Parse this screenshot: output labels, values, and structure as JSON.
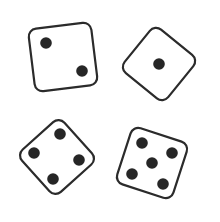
{
  "scene": {
    "description": "Four dice on a white background",
    "background": "#ffffff",
    "stroke_color": "#2b2b2b",
    "pip_color": "#262626"
  },
  "dice": [
    {
      "name": "die-two",
      "value": 2,
      "cx": 63,
      "cy": 57,
      "size": 63,
      "rotation": -7,
      "pips": [
        [
          46,
          43
        ],
        [
          82,
          71
        ]
      ]
    },
    {
      "name": "die-one",
      "value": 1,
      "cx": 159,
      "cy": 64,
      "size": 56,
      "rotation": 39,
      "pips": [
        [
          159,
          64
        ]
      ]
    },
    {
      "name": "die-four",
      "value": 4,
      "cx": 57,
      "cy": 157,
      "size": 57,
      "rotation": 48,
      "pips": [
        [
          60,
          134
        ],
        [
          34,
          153
        ],
        [
          79,
          160
        ],
        [
          53,
          179
        ]
      ]
    },
    {
      "name": "die-five",
      "value": 5,
      "cx": 152,
      "cy": 163,
      "size": 59,
      "rotation": 18,
      "pips": [
        [
          142,
          143
        ],
        [
          172,
          153
        ],
        [
          152,
          163
        ],
        [
          132,
          174
        ],
        [
          163,
          184
        ]
      ]
    }
  ]
}
